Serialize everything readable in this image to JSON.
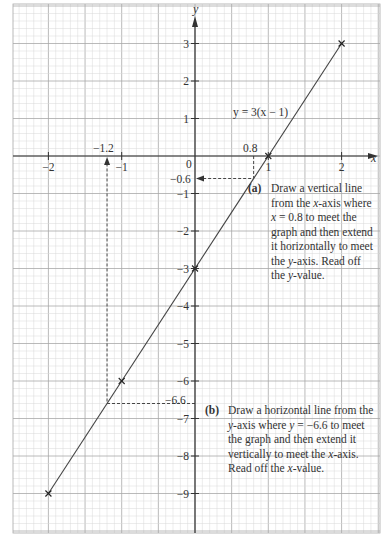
{
  "chart_data": {
    "type": "line",
    "title": "",
    "xlabel": "x",
    "ylabel": "y",
    "xlim": [
      -2.5,
      2.5
    ],
    "ylim": [
      -10.2,
      4
    ],
    "grid": true,
    "x_ticks": [
      -2,
      -1,
      1,
      2
    ],
    "x_tick_labels": [
      "−2",
      "−1",
      "1",
      "2"
    ],
    "y_ticks": [
      3,
      2,
      1,
      -1,
      -2,
      -3,
      -4,
      -5,
      -6,
      -7,
      -8,
      -9
    ],
    "y_tick_labels": [
      "3",
      "2",
      "1",
      "−1",
      "−2",
      "−3",
      "−4",
      "−5",
      "−6",
      "−7",
      "−8",
      "−9"
    ],
    "origin_label": "0",
    "series": [
      {
        "name": "y = 3(x − 1)",
        "x": [
          -2,
          2
        ],
        "y": [
          -9,
          3
        ],
        "marked_points": [
          {
            "x": -2,
            "y": -9
          },
          {
            "x": -1,
            "y": -6
          },
          {
            "x": 0,
            "y": -3
          },
          {
            "x": 1,
            "y": 0
          },
          {
            "x": 2,
            "y": 3
          }
        ]
      }
    ],
    "annotations": [
      {
        "type": "dashed-guide",
        "from_x": 0.8,
        "to_y": -0.6,
        "x_label": "0.8",
        "y_label": "−0.6"
      },
      {
        "type": "dashed-guide",
        "from_y": -6.6,
        "to_x": -1.2,
        "x_label": "−1.2",
        "y_label": "−6.6"
      }
    ]
  },
  "labels": {
    "equation": "y = 3(x − 1)",
    "x_axis": "x",
    "y_axis": "y",
    "guide_a_x": "0.8",
    "guide_a_y": "−0.6",
    "guide_b_x": "−1.2",
    "guide_b_y": "−6.6"
  },
  "notes": {
    "a_label": "(a)",
    "a_text": "Draw a vertical line from the x-axis where x = 0.8 to meet the graph and then extend it horizontally to meet the y-axis. Read off the y-value.",
    "b_label": "(b)",
    "b_text": "Draw a horizontal line from the y-axis where y = −6.6 to meet the graph and then extend it vertically to meet the x-axis. Read off the x-value."
  },
  "colors": {
    "grid_minor": "#d9d9d9",
    "grid_major": "#a8a8a8",
    "axis": "#333333",
    "line": "#444444",
    "text": "#333333"
  }
}
